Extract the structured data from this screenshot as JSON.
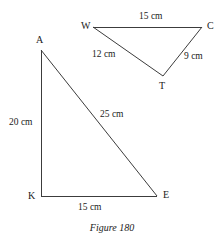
{
  "figure": {
    "caption": "Figure 180",
    "stroke_color": "#3c3c3c",
    "text_color": "#1a1a1a",
    "background_color": "#ffffff"
  },
  "triangles": [
    {
      "name": "triangle-wct",
      "vertices": [
        {
          "label": "W",
          "x": 93,
          "y": 27,
          "label_x": 81,
          "label_y": 20
        },
        {
          "label": "C",
          "x": 202,
          "y": 27,
          "label_x": 207,
          "label_y": 20
        },
        {
          "label": "T",
          "x": 163,
          "y": 76,
          "label_x": 159,
          "label_y": 80
        }
      ],
      "sides": [
        {
          "name": "side-wc",
          "from": "W",
          "to": "C",
          "length": "15 cm",
          "label_x": 139,
          "label_y": 11
        },
        {
          "name": "side-wt",
          "from": "W",
          "to": "T",
          "length": "12 cm",
          "label_x": 92,
          "label_y": 49
        },
        {
          "name": "side-tc",
          "from": "T",
          "to": "C",
          "length": "9 cm",
          "label_x": 184,
          "label_y": 51
        }
      ]
    },
    {
      "name": "triangle-ake",
      "vertices": [
        {
          "label": "A",
          "x": 41,
          "y": 50,
          "label_x": 36,
          "label_y": 34
        },
        {
          "label": "K",
          "x": 41,
          "y": 196,
          "label_x": 28,
          "label_y": 190
        },
        {
          "label": "E",
          "x": 157,
          "y": 196,
          "label_x": 163,
          "label_y": 189
        }
      ],
      "sides": [
        {
          "name": "side-ak",
          "from": "A",
          "to": "K",
          "length": "20 cm",
          "label_x": 9,
          "label_y": 117
        },
        {
          "name": "side-ae",
          "from": "A",
          "to": "E",
          "length": "25 cm",
          "label_x": 100,
          "label_y": 109
        },
        {
          "name": "side-ke",
          "from": "K",
          "to": "E",
          "length": "15 cm",
          "label_x": 78,
          "label_y": 202
        }
      ]
    }
  ]
}
